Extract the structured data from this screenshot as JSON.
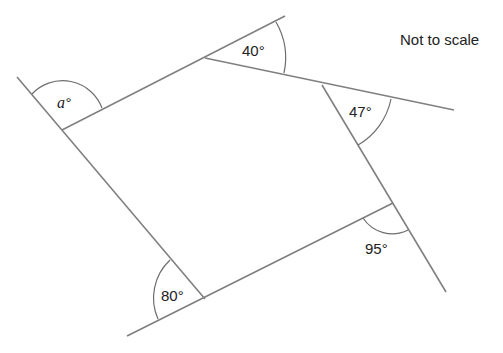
{
  "note": "Not to scale",
  "angles": {
    "a": {
      "label": "a°",
      "var": "a",
      "deg_symbol": "°"
    },
    "top": {
      "label": "40°"
    },
    "right_upper": {
      "label": "47°"
    },
    "right_lower": {
      "label": "95°"
    },
    "bottom_left": {
      "label": "80°"
    }
  },
  "colors": {
    "line": "#808080",
    "text": "#222222",
    "background": "#ffffff"
  }
}
